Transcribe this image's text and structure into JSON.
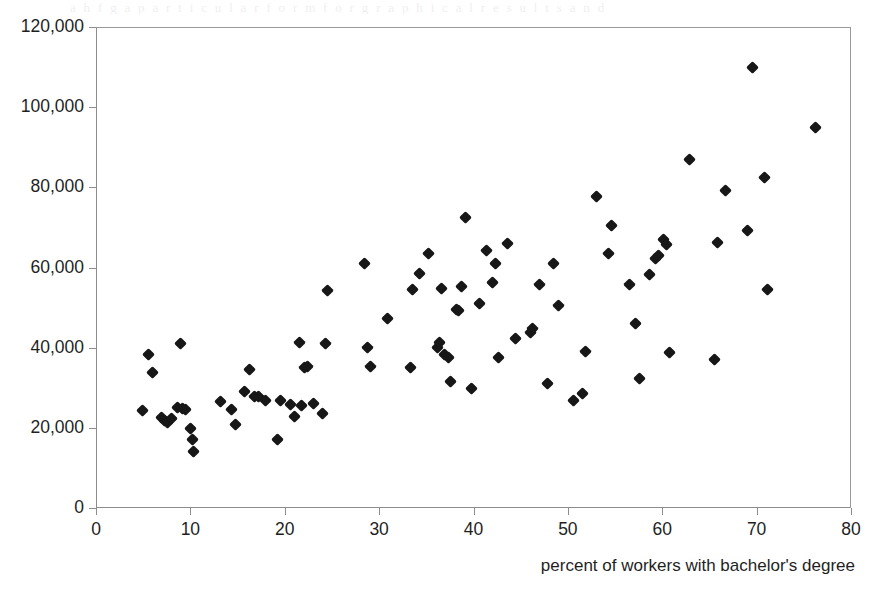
{
  "figure": {
    "ghost_text": "a h  f    g   a p a r t i c u l a r  f o r m   f o r   g r a p h i c a l   r e s u l t s  a n d",
    "background_color": "#ffffff",
    "marker_color": "#171717",
    "axis_color": "#8d8d8d"
  },
  "axes": {
    "x_title": "percent of workers with bachelor's degree",
    "y_title": "",
    "x_ticks": [
      "0",
      "10",
      "20",
      "30",
      "40",
      "50",
      "60",
      "70",
      "80"
    ],
    "y_ticks": [
      "0",
      "20,000",
      "40,000",
      "60,000",
      "80,000",
      "100,000",
      "120,000"
    ]
  },
  "chart_data": {
    "type": "scatter",
    "title": "",
    "xlabel": "percent of workers with bachelor's degree",
    "ylabel": "",
    "xlim": [
      0,
      80
    ],
    "ylim": [
      0,
      120000
    ],
    "xticks": [
      0,
      10,
      20,
      30,
      40,
      50,
      60,
      70,
      80
    ],
    "yticks": [
      0,
      20000,
      40000,
      60000,
      80000,
      100000,
      120000
    ],
    "grid": false,
    "legend": null,
    "marker": "diamond",
    "n_points": 98,
    "points": [
      [
        4.9,
        24300
      ],
      [
        5.6,
        38200
      ],
      [
        6.0,
        33900
      ],
      [
        6.9,
        22600
      ],
      [
        7.3,
        21900
      ],
      [
        7.6,
        21400
      ],
      [
        8.0,
        22300
      ],
      [
        8.6,
        25000
      ],
      [
        9.0,
        41000
      ],
      [
        9.2,
        24900
      ],
      [
        9.5,
        24600
      ],
      [
        10.0,
        19900
      ],
      [
        10.2,
        17000
      ],
      [
        10.3,
        14000
      ],
      [
        13.2,
        26600
      ],
      [
        14.4,
        24500
      ],
      [
        14.8,
        20900
      ],
      [
        15.7,
        29000
      ],
      [
        16.3,
        34500
      ],
      [
        16.8,
        27900
      ],
      [
        17.2,
        27800
      ],
      [
        18.0,
        26900
      ],
      [
        19.2,
        17200
      ],
      [
        19.6,
        26800
      ],
      [
        20.6,
        25900
      ],
      [
        21.0,
        22800
      ],
      [
        21.6,
        41200
      ],
      [
        21.8,
        25600
      ],
      [
        22.1,
        35000
      ],
      [
        22.4,
        35300
      ],
      [
        23.0,
        26000
      ],
      [
        24.0,
        23500
      ],
      [
        24.3,
        41000
      ],
      [
        24.5,
        54200
      ],
      [
        28.4,
        61000
      ],
      [
        28.8,
        40000
      ],
      [
        29.1,
        35400
      ],
      [
        30.9,
        47200
      ],
      [
        33.3,
        35000
      ],
      [
        33.5,
        54500
      ],
      [
        34.3,
        58500
      ],
      [
        35.2,
        63400
      ],
      [
        36.2,
        40000
      ],
      [
        36.4,
        41300
      ],
      [
        36.6,
        54700
      ],
      [
        36.9,
        38200
      ],
      [
        37.3,
        37600
      ],
      [
        37.6,
        31600
      ],
      [
        38.2,
        49500
      ],
      [
        38.4,
        49300
      ],
      [
        38.7,
        55200
      ],
      [
        39.2,
        72400
      ],
      [
        39.8,
        29700
      ],
      [
        40.6,
        51000
      ],
      [
        41.4,
        64300
      ],
      [
        42.0,
        56300
      ],
      [
        42.3,
        61000
      ],
      [
        42.6,
        37500
      ],
      [
        43.6,
        65900
      ],
      [
        44.5,
        42400
      ],
      [
        46.0,
        43900
      ],
      [
        46.3,
        44900
      ],
      [
        47.0,
        55800
      ],
      [
        47.8,
        31000
      ],
      [
        48.5,
        61000
      ],
      [
        49.0,
        50400
      ],
      [
        50.6,
        26900
      ],
      [
        51.5,
        28500
      ],
      [
        51.9,
        39100
      ],
      [
        53.0,
        77600
      ],
      [
        54.3,
        63600
      ],
      [
        54.6,
        70500
      ],
      [
        56.5,
        55700
      ],
      [
        57.2,
        46000
      ],
      [
        57.6,
        32300
      ],
      [
        58.6,
        58200
      ],
      [
        59.3,
        62300
      ],
      [
        59.6,
        63000
      ],
      [
        60.1,
        67100
      ],
      [
        60.4,
        65800
      ],
      [
        60.8,
        38900
      ],
      [
        62.9,
        87000
      ],
      [
        65.5,
        37000
      ],
      [
        65.9,
        66300
      ],
      [
        66.7,
        79100
      ],
      [
        69.0,
        69300
      ],
      [
        69.6,
        110000
      ],
      [
        70.8,
        82400
      ],
      [
        71.2,
        54600
      ],
      [
        76.2,
        95000
      ]
    ]
  }
}
